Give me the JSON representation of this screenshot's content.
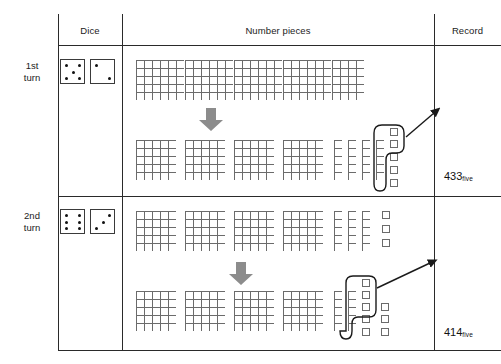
{
  "header": {
    "col_dice": "Dice",
    "col_number_pieces": "Number pieces",
    "col_record": "Record"
  },
  "rows": [
    {
      "turn_label_line1": "1st",
      "turn_label_line2": "turn",
      "dice": [
        {
          "name": "die-left",
          "value": 5
        },
        {
          "name": "die-right",
          "value": 2
        }
      ],
      "record_value": "433",
      "record_subscript": "five",
      "before": {
        "description": "long 5-high strip of squares divided into blocks",
        "flats": 0,
        "strip_columns": 43,
        "rows_high": 5
      },
      "after": {
        "flats": 4,
        "rods": 4,
        "units": 5,
        "circled_group": {
          "rods": 1,
          "units": 2
        }
      }
    },
    {
      "turn_label_line1": "2nd",
      "turn_label_line2": "turn",
      "dice": [
        {
          "name": "die-left",
          "value": 6
        },
        {
          "name": "die-right",
          "value": 3
        }
      ],
      "record_value": "414",
      "record_subscript": "five",
      "before": {
        "flats": 4,
        "rods": 3,
        "units": 3,
        "rows_high": 5
      },
      "after": {
        "flats": 4,
        "rods": 2,
        "units": 8,
        "circled_group": {
          "rods": 1,
          "units": 4
        }
      }
    }
  ],
  "colors": {
    "grid_line": "#6b6b6b",
    "rule_line": "#2a2a2a",
    "down_arrow": "#8c8c8c",
    "loop_stroke": "#1a1a1a",
    "text": "#1b1b1b"
  },
  "arrows": {
    "down_arrow_label": "transform-down-arrow",
    "pointer_label": "regroup-pointer-arrow"
  }
}
